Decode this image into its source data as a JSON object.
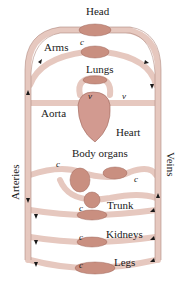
{
  "diagram": {
    "colors": {
      "vessel": "#e6c8bf",
      "vessel_edge": "#b08a80",
      "organ": "#c98f80",
      "heart": "#d29a90",
      "arrow": "#1a1a1a",
      "background": "#ffffff"
    },
    "labels": {
      "head": "Head",
      "arms": "Arms",
      "lungs": "Lungs",
      "aorta": "Aorta",
      "heart": "Heart",
      "body_organs": "Body organs",
      "trunk": "Trunk",
      "kidneys": "Kidneys",
      "legs": "Legs",
      "arteries": "Arteries",
      "veins": "Veins"
    },
    "markers": {
      "capillary": "c",
      "valve": "v"
    }
  }
}
